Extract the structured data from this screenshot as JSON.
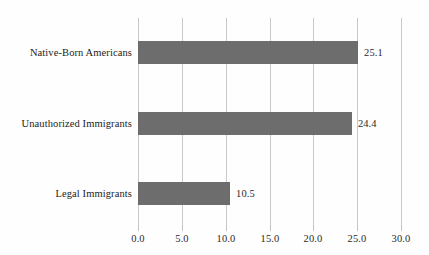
{
  "chart_data": {
    "type": "bar",
    "orientation": "horizontal",
    "title": "",
    "subtitle": "",
    "xlabel": "",
    "ylabel": "",
    "categories": [
      "Native-Born Americans",
      "Unauthorized Immigrants",
      "Legal Immigrants"
    ],
    "values": [
      25.1,
      24.4,
      10.5
    ],
    "value_labels": [
      "25.1",
      "24.4",
      "10.5"
    ],
    "xlim": [
      0.0,
      30.0
    ],
    "xticks": [
      0.0,
      5.0,
      10.0,
      15.0,
      20.0,
      25.0,
      30.0
    ],
    "xtick_labels": [
      "0.0",
      "5.0",
      "10.0",
      "15.0",
      "20.0",
      "25.0",
      "30.0"
    ],
    "grid": true,
    "grid_axis": "x",
    "legend": false,
    "legend_position": "none",
    "series": [
      {
        "name": "",
        "values": [
          25.1,
          24.4,
          10.5
        ]
      }
    ]
  },
  "style": {
    "bar_color": "#6d6d6d",
    "grid_color": "#c9c9c9",
    "tick_color": "#c2c2c2",
    "text_color": "#1c1c1c",
    "value_text_color": "#2b2b2b",
    "background": "#fefefe"
  }
}
